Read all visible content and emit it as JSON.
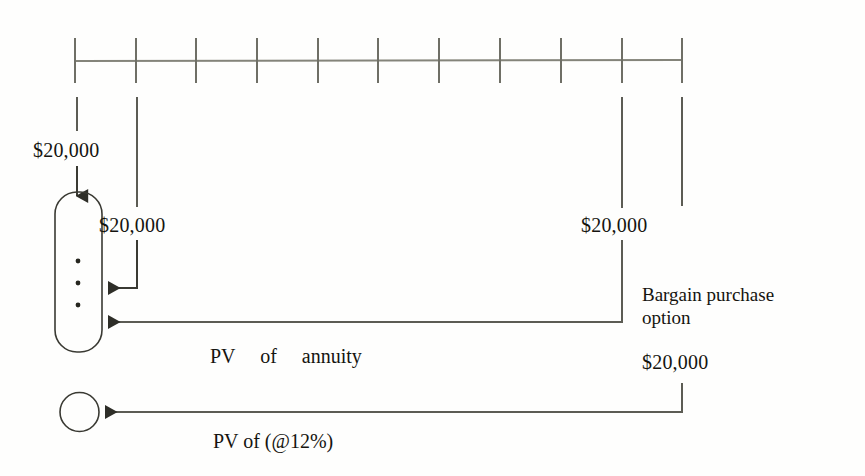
{
  "diagram": {
    "type": "lease-present-value-timeline",
    "interest_rate_text": "@12%",
    "timeline": {
      "tick_count": 11,
      "axis_y": 60,
      "first_tick_x": 75,
      "tick_spacing": 60.7,
      "tick_half_height": 22
    },
    "payments": [
      {
        "id": "payment-period-0",
        "amount": "$20,000",
        "tick_index": 0
      },
      {
        "id": "payment-period-1",
        "amount": "$20,000",
        "tick_index": 1
      },
      {
        "id": "payment-period-9",
        "amount": "$20,000",
        "tick_index": 9
      },
      {
        "id": "bargain-purchase-amount",
        "amount": "$20,000",
        "tick_index": 10
      }
    ],
    "labels": {
      "amount_period_0": "$20,000",
      "amount_period_1": "$20,000",
      "amount_period_9": "$20,000",
      "bargain_option_line1": "Bargain purchase",
      "bargain_option_line2": "option",
      "bargain_option_amount": "$20,000",
      "pv_of_annuity": "PV     of     annuity",
      "pv_of_rate": "PV of (@12%)",
      "ellipsis_dots": "•"
    },
    "shapes": {
      "annuity_box": {
        "name": "pv-of-annuity-box",
        "x": 55,
        "y": 192,
        "width": 47,
        "height": 160,
        "radius": 22
      },
      "total_pv_circle": {
        "name": "total-present-value-circle",
        "cx": 79.5,
        "cy": 412,
        "r": 19.5
      },
      "dots": [
        {
          "cx": 78,
          "cy": 261
        },
        {
          "cx": 78,
          "cy": 283
        },
        {
          "cx": 78,
          "cy": 305
        }
      ]
    },
    "colors": {
      "background": "#fefefd",
      "line": "#77776d",
      "dark_line": "#3a3a33",
      "text": "#15140f"
    }
  }
}
